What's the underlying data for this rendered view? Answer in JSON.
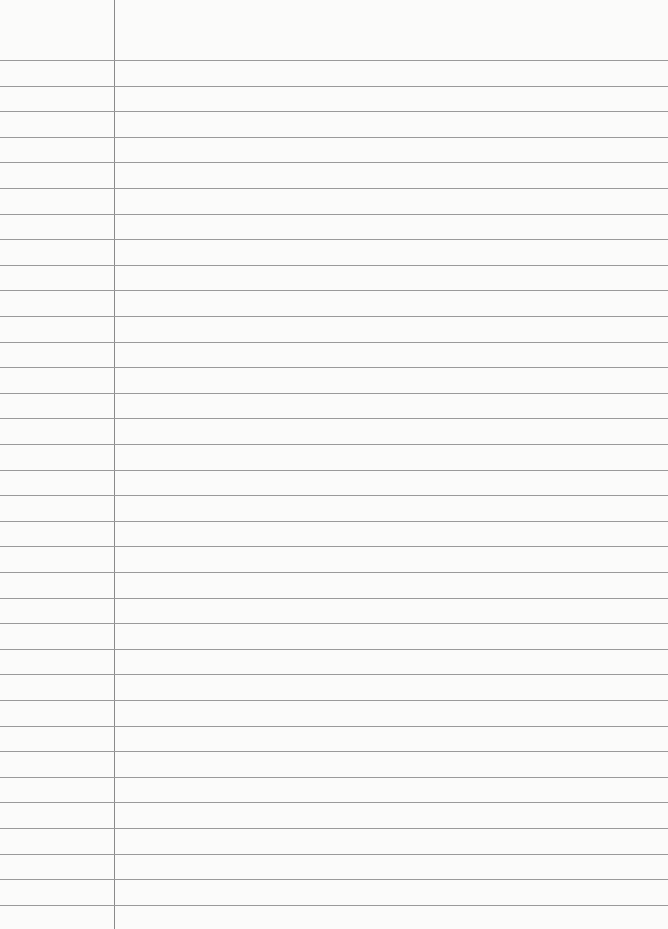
{
  "paper": {
    "type": "ruled-notebook-page",
    "line_count": 34,
    "first_line_y": 60,
    "line_spacing": 25.6,
    "margin_x": 114,
    "line_color": "#9a9a9a",
    "margin_color": "#8a8a8a",
    "background": "#fbfbfa"
  }
}
